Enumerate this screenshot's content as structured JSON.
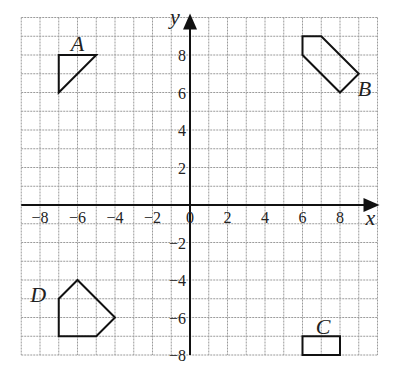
{
  "diagram": {
    "type": "coordinate-grid",
    "x_range": [
      -9,
      10
    ],
    "y_range": [
      -8,
      10
    ],
    "origin_px": [
      190,
      205
    ],
    "unit_px": 18.75,
    "axis_labels": {
      "x": "x",
      "y": "y"
    },
    "x_ticks": [
      {
        "value": -8,
        "label": "−8"
      },
      {
        "value": -6,
        "label": "−6"
      },
      {
        "value": -4,
        "label": "−4"
      },
      {
        "value": -2,
        "label": "−2"
      },
      {
        "value": 0,
        "label": "0"
      },
      {
        "value": 2,
        "label": "2"
      },
      {
        "value": 4,
        "label": "4"
      },
      {
        "value": 6,
        "label": "6"
      },
      {
        "value": 8,
        "label": "8"
      }
    ],
    "y_ticks": [
      {
        "value": 8,
        "label": "8"
      },
      {
        "value": 6,
        "label": "6"
      },
      {
        "value": 4,
        "label": "4"
      },
      {
        "value": 2,
        "label": "2"
      },
      {
        "value": -2,
        "label": "−2"
      },
      {
        "value": -4,
        "label": "−4"
      },
      {
        "value": -6,
        "label": "−6"
      },
      {
        "value": -8,
        "label": "−8"
      }
    ],
    "shapes": [
      {
        "label": "A",
        "points": [
          [
            -7,
            8
          ],
          [
            -5,
            8
          ],
          [
            -7,
            6
          ]
        ],
        "label_pos": [
          -6,
          8.6
        ]
      },
      {
        "label": "B",
        "points": [
          [
            6,
            9
          ],
          [
            7,
            9
          ],
          [
            9,
            7
          ],
          [
            8,
            6
          ],
          [
            6,
            8
          ]
        ],
        "label_pos": [
          9.3,
          6.2
        ]
      },
      {
        "label": "C",
        "points": [
          [
            6,
            -7
          ],
          [
            8,
            -7
          ],
          [
            8,
            -8
          ],
          [
            6,
            -8
          ]
        ],
        "label_pos": [
          7.1,
          -6.5
        ]
      },
      {
        "label": "D",
        "points": [
          [
            -7,
            -5
          ],
          [
            -6,
            -4
          ],
          [
            -4,
            -6
          ],
          [
            -5,
            -7
          ],
          [
            -7,
            -7
          ]
        ],
        "label_pos": [
          -8.1,
          -4.8
        ]
      }
    ],
    "colors": {
      "grid": "#9a9a9a",
      "axis": "#111111",
      "shape": "#111111"
    }
  }
}
